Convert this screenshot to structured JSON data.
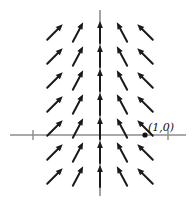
{
  "figure": {
    "width": 193,
    "height": 204,
    "background_color": "#ffffff"
  },
  "axes": {
    "axis_color": "#8c8c8c",
    "origin": {
      "x": 100,
      "y": 135
    },
    "x_axis": {
      "x1": 10,
      "y1": 135,
      "x2": 186,
      "y2": 135
    },
    "y_axis": {
      "x1": 100,
      "y1": 10,
      "x2": 100,
      "y2": 196
    },
    "x_ticks": [
      {
        "x": 33,
        "label": ""
      },
      {
        "x": 168,
        "label": ""
      }
    ],
    "y_ticks": []
  },
  "annotations": {
    "point_label": "(1,0)",
    "point_label_x": 148,
    "point_label_y": 131,
    "point_marker": {
      "x": 145,
      "y": 135,
      "r": 2.6
    }
  },
  "chart_data": {
    "type": "scatter",
    "title": "",
    "xlabel": "",
    "ylabel": "",
    "arrow_color": "#1a1a1a",
    "grid_columns_px": [
      55,
      78,
      100,
      122,
      145
    ],
    "grid_rows_px": [
      32,
      56,
      80,
      104,
      128,
      152,
      176
    ],
    "arrow_length": 22,
    "arrows": [
      {
        "col": 0,
        "row": 0,
        "x": 55,
        "y": 32,
        "angle_deg": 45
      },
      {
        "col": 1,
        "row": 0,
        "x": 78,
        "y": 32,
        "angle_deg": 62
      },
      {
        "col": 2,
        "row": 0,
        "x": 100,
        "y": 32,
        "angle_deg": 90
      },
      {
        "col": 3,
        "row": 0,
        "x": 122,
        "y": 32,
        "angle_deg": 118
      },
      {
        "col": 4,
        "row": 0,
        "x": 145,
        "y": 32,
        "angle_deg": 135
      },
      {
        "col": 0,
        "row": 1,
        "x": 55,
        "y": 56,
        "angle_deg": 45
      },
      {
        "col": 1,
        "row": 1,
        "x": 78,
        "y": 56,
        "angle_deg": 62
      },
      {
        "col": 2,
        "row": 1,
        "x": 100,
        "y": 56,
        "angle_deg": 90
      },
      {
        "col": 3,
        "row": 1,
        "x": 122,
        "y": 56,
        "angle_deg": 118
      },
      {
        "col": 4,
        "row": 1,
        "x": 145,
        "y": 56,
        "angle_deg": 135
      },
      {
        "col": 0,
        "row": 2,
        "x": 55,
        "y": 80,
        "angle_deg": 45
      },
      {
        "col": 1,
        "row": 2,
        "x": 78,
        "y": 80,
        "angle_deg": 62
      },
      {
        "col": 2,
        "row": 2,
        "x": 100,
        "y": 80,
        "angle_deg": 90
      },
      {
        "col": 3,
        "row": 2,
        "x": 122,
        "y": 80,
        "angle_deg": 118
      },
      {
        "col": 4,
        "row": 2,
        "x": 145,
        "y": 80,
        "angle_deg": 135
      },
      {
        "col": 0,
        "row": 3,
        "x": 55,
        "y": 104,
        "angle_deg": 45
      },
      {
        "col": 1,
        "row": 3,
        "x": 78,
        "y": 104,
        "angle_deg": 62
      },
      {
        "col": 2,
        "row": 3,
        "x": 100,
        "y": 104,
        "angle_deg": 90
      },
      {
        "col": 3,
        "row": 3,
        "x": 122,
        "y": 104,
        "angle_deg": 118
      },
      {
        "col": 4,
        "row": 3,
        "x": 145,
        "y": 104,
        "angle_deg": 135
      },
      {
        "col": 0,
        "row": 4,
        "x": 55,
        "y": 128,
        "angle_deg": 45
      },
      {
        "col": 1,
        "row": 4,
        "x": 78,
        "y": 128,
        "angle_deg": 62
      },
      {
        "col": 2,
        "row": 4,
        "x": 100,
        "y": 128,
        "angle_deg": 90
      },
      {
        "col": 3,
        "row": 4,
        "x": 122,
        "y": 128,
        "angle_deg": 118
      },
      {
        "col": 4,
        "row": 4,
        "x": 145,
        "y": 128,
        "angle_deg": 135
      },
      {
        "col": 0,
        "row": 5,
        "x": 55,
        "y": 152,
        "angle_deg": 45
      },
      {
        "col": 1,
        "row": 5,
        "x": 78,
        "y": 152,
        "angle_deg": 62
      },
      {
        "col": 2,
        "row": 5,
        "x": 100,
        "y": 152,
        "angle_deg": 90
      },
      {
        "col": 3,
        "row": 5,
        "x": 122,
        "y": 152,
        "angle_deg": 118
      },
      {
        "col": 4,
        "row": 5,
        "x": 145,
        "y": 152,
        "angle_deg": 135
      },
      {
        "col": 0,
        "row": 6,
        "x": 55,
        "y": 176,
        "angle_deg": 45
      },
      {
        "col": 1,
        "row": 6,
        "x": 78,
        "y": 176,
        "angle_deg": 62
      },
      {
        "col": 2,
        "row": 6,
        "x": 100,
        "y": 176,
        "angle_deg": 90
      },
      {
        "col": 3,
        "row": 6,
        "x": 122,
        "y": 176,
        "angle_deg": 118
      },
      {
        "col": 4,
        "row": 6,
        "x": 145,
        "y": 176,
        "angle_deg": 135
      }
    ]
  }
}
